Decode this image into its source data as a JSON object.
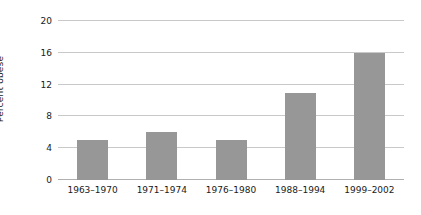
{
  "chart_data": {
    "type": "bar",
    "title": "",
    "xlabel": "",
    "ylabel": "Percent obese",
    "categories": [
      "1963–1970",
      "1971–1974",
      "1976–1980",
      "1988–1994",
      "1999–2002"
    ],
    "values": [
      5,
      6,
      5,
      11,
      16
    ],
    "ylim": [
      0,
      20
    ],
    "yticks": [
      0,
      4,
      8,
      12,
      16,
      20
    ],
    "ytick_labels": [
      "0",
      "4",
      "8",
      "12",
      "16",
      "20"
    ],
    "grid": true,
    "legend": false,
    "legend_position": "none",
    "colors": {
      "bar_fill": "#979797",
      "gridline": "#c9c9c9",
      "baseline": "#b0b0b0",
      "background": "#ffffff",
      "text": "#1a1a1a"
    }
  }
}
